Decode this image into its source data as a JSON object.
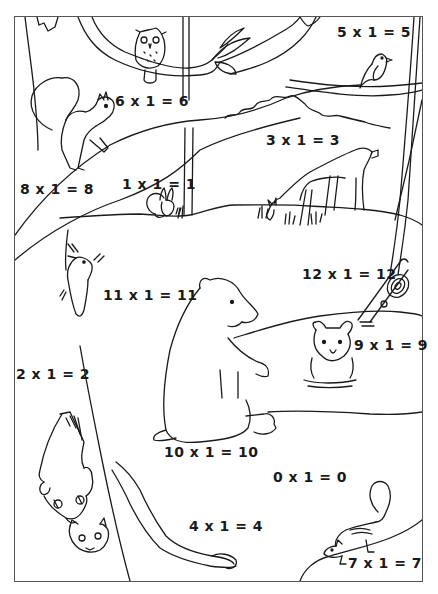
{
  "worksheet": {
    "type": "multiplication coloring page",
    "equations": [
      {
        "id": "eq-5",
        "text": "5 x 1 = 5",
        "x": 337,
        "y": 24
      },
      {
        "id": "eq-6",
        "text": "6 x 1 = 6",
        "x": 115,
        "y": 93
      },
      {
        "id": "eq-3",
        "text": "3 x 1 = 3",
        "x": 266,
        "y": 132
      },
      {
        "id": "eq-1",
        "text": "1 x 1 = 1",
        "x": 122,
        "y": 176
      },
      {
        "id": "eq-8",
        "text": "8 x 1 = 8",
        "x": 20,
        "y": 181
      },
      {
        "id": "eq-12",
        "text": "12 x 1 = 12",
        "x": 302,
        "y": 266
      },
      {
        "id": "eq-11",
        "text": "11 x 1 = 11",
        "x": 103,
        "y": 287
      },
      {
        "id": "eq-9",
        "text": "9 x 1 = 9",
        "x": 354,
        "y": 337
      },
      {
        "id": "eq-2",
        "text": "2 x 1 = 2",
        "x": 16,
        "y": 366
      },
      {
        "id": "eq-10",
        "text": "10 x 1 = 10",
        "x": 164,
        "y": 444
      },
      {
        "id": "eq-0",
        "text": "0 x 1 = 0",
        "x": 273,
        "y": 469
      },
      {
        "id": "eq-4",
        "text": "4 x 1 = 4",
        "x": 189,
        "y": 518
      },
      {
        "id": "eq-7",
        "text": "7 x 1 = 7",
        "x": 348,
        "y": 555
      }
    ],
    "animals": [
      "owl",
      "bird",
      "squirrel",
      "rabbit",
      "deer",
      "woodpecker",
      "bear",
      "bear cub",
      "raccoon",
      "raccoon kit",
      "chipmunk"
    ],
    "colors": {
      "line": "#1a1a1a",
      "frame": "#555555",
      "background": "#ffffff"
    }
  }
}
